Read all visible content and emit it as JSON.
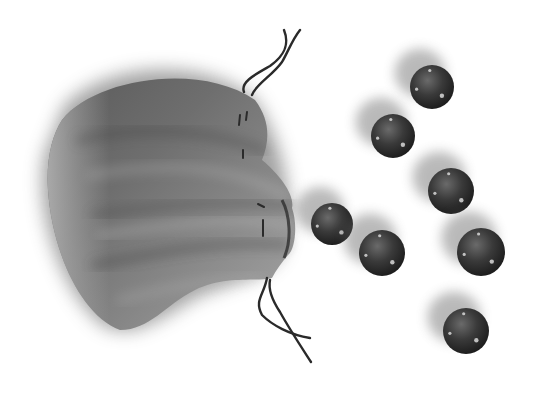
{
  "scene": {
    "description": "Grayscale illustration of a drawstring pouch with marbles spilling out",
    "background": "#ffffff",
    "pouch": {
      "color_dark": "#3e3e3e",
      "color_mid": "#6a6a6a",
      "color_light": "#a8a8a8",
      "string_color": "#2a2a2a"
    },
    "marbles": [
      {
        "cx": 432,
        "cy": 87,
        "r": 22
      },
      {
        "cx": 393,
        "cy": 136,
        "r": 22
      },
      {
        "cx": 451,
        "cy": 191,
        "r": 23
      },
      {
        "cx": 332,
        "cy": 224,
        "r": 21
      },
      {
        "cx": 382,
        "cy": 253,
        "r": 23
      },
      {
        "cx": 481,
        "cy": 252,
        "r": 24
      },
      {
        "cx": 466,
        "cy": 331,
        "r": 23
      }
    ],
    "marble_colors": {
      "dark": "#1e1e1e",
      "mid": "#4a4a4a",
      "highlight": "#d8d8d8"
    }
  }
}
